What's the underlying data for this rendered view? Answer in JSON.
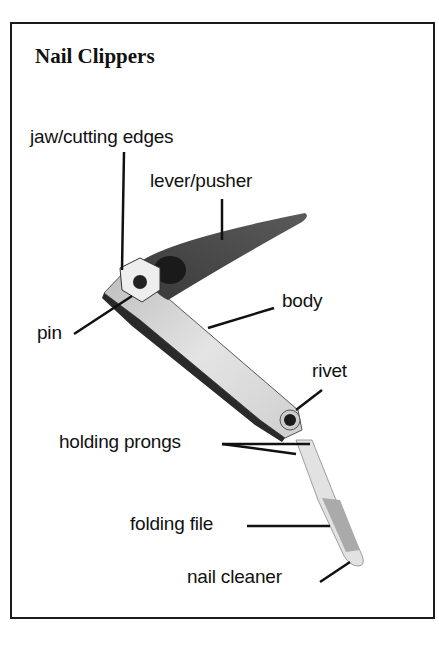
{
  "title": "Nail Clippers",
  "labels": {
    "jaw": "jaw/cutting edges",
    "lever": "lever/pusher",
    "body": "body",
    "pin": "pin",
    "rivet": "rivet",
    "prongs": "holding prongs",
    "file": "folding file",
    "cleaner": "nail cleaner"
  }
}
